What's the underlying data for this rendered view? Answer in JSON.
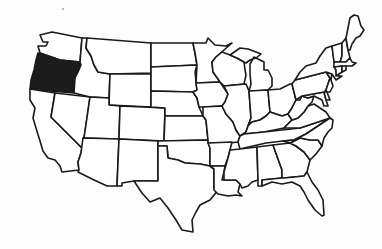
{
  "map": {
    "title": "United States map with Oregon highlighted",
    "highlighted_state": "Oregon",
    "colors": {
      "background": "#fdfdfd",
      "state_fill": "#ffffff",
      "highlight_fill": "#1c1c1c",
      "border": "#1a1a1a"
    },
    "states": [
      {
        "id": "WA",
        "name": "Washington",
        "highlighted": false
      },
      {
        "id": "OR",
        "name": "Oregon",
        "highlighted": true
      },
      {
        "id": "CA",
        "name": "California",
        "highlighted": false
      },
      {
        "id": "NV",
        "name": "Nevada",
        "highlighted": false
      },
      {
        "id": "ID",
        "name": "Idaho",
        "highlighted": false
      },
      {
        "id": "MT",
        "name": "Montana",
        "highlighted": false
      },
      {
        "id": "WY",
        "name": "Wyoming",
        "highlighted": false
      },
      {
        "id": "UT",
        "name": "Utah",
        "highlighted": false
      },
      {
        "id": "AZ",
        "name": "Arizona",
        "highlighted": false
      },
      {
        "id": "CO",
        "name": "Colorado",
        "highlighted": false
      },
      {
        "id": "NM",
        "name": "New Mexico",
        "highlighted": false
      },
      {
        "id": "ND",
        "name": "North Dakota",
        "highlighted": false
      },
      {
        "id": "SD",
        "name": "South Dakota",
        "highlighted": false
      },
      {
        "id": "NE",
        "name": "Nebraska",
        "highlighted": false
      },
      {
        "id": "KS",
        "name": "Kansas",
        "highlighted": false
      },
      {
        "id": "OK",
        "name": "Oklahoma",
        "highlighted": false
      },
      {
        "id": "TX",
        "name": "Texas",
        "highlighted": false
      },
      {
        "id": "MN",
        "name": "Minnesota",
        "highlighted": false
      },
      {
        "id": "IA",
        "name": "Iowa",
        "highlighted": false
      },
      {
        "id": "MO",
        "name": "Missouri",
        "highlighted": false
      },
      {
        "id": "AR",
        "name": "Arkansas",
        "highlighted": false
      },
      {
        "id": "LA",
        "name": "Louisiana",
        "highlighted": false
      },
      {
        "id": "WI",
        "name": "Wisconsin",
        "highlighted": false
      },
      {
        "id": "IL",
        "name": "Illinois",
        "highlighted": false
      },
      {
        "id": "MI",
        "name": "Michigan",
        "highlighted": false
      },
      {
        "id": "IN",
        "name": "Indiana",
        "highlighted": false
      },
      {
        "id": "OH",
        "name": "Ohio",
        "highlighted": false
      },
      {
        "id": "KY",
        "name": "Kentucky",
        "highlighted": false
      },
      {
        "id": "TN",
        "name": "Tennessee",
        "highlighted": false
      },
      {
        "id": "MS",
        "name": "Mississippi",
        "highlighted": false
      },
      {
        "id": "AL",
        "name": "Alabama",
        "highlighted": false
      },
      {
        "id": "GA",
        "name": "Georgia",
        "highlighted": false
      },
      {
        "id": "FL",
        "name": "Florida",
        "highlighted": false
      },
      {
        "id": "SC",
        "name": "South Carolina",
        "highlighted": false
      },
      {
        "id": "NC",
        "name": "North Carolina",
        "highlighted": false
      },
      {
        "id": "VA",
        "name": "Virginia",
        "highlighted": false
      },
      {
        "id": "WV",
        "name": "West Virginia",
        "highlighted": false
      },
      {
        "id": "MD",
        "name": "Maryland",
        "highlighted": false
      },
      {
        "id": "DE",
        "name": "Delaware",
        "highlighted": false
      },
      {
        "id": "PA",
        "name": "Pennsylvania",
        "highlighted": false
      },
      {
        "id": "NJ",
        "name": "New Jersey",
        "highlighted": false
      },
      {
        "id": "NY",
        "name": "New York",
        "highlighted": false
      },
      {
        "id": "CT",
        "name": "Connecticut",
        "highlighted": false
      },
      {
        "id": "RI",
        "name": "Rhode Island",
        "highlighted": false
      },
      {
        "id": "MA",
        "name": "Massachusetts",
        "highlighted": false
      },
      {
        "id": "VT",
        "name": "Vermont",
        "highlighted": false
      },
      {
        "id": "NH",
        "name": "New Hampshire",
        "highlighted": false
      },
      {
        "id": "ME",
        "name": "Maine",
        "highlighted": false
      }
    ]
  }
}
